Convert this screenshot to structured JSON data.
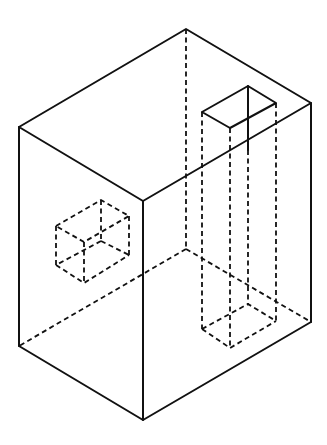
{
  "diagram": {
    "title": "",
    "colors": {
      "line": "#111111",
      "background": "#ffffff"
    },
    "box": {
      "top": [
        186,
        29
      ],
      "left_top": [
        19,
        127
      ],
      "front_top": [
        143,
        201
      ],
      "right_top": [
        311,
        103
      ],
      "left_bottom": [
        19,
        346
      ],
      "front_bottom": [
        143,
        420
      ],
      "right_bottom": [
        311,
        322
      ],
      "back_bottom_hidden": [
        186,
        249
      ]
    },
    "pillar": {
      "top": {
        "left": [
          202,
          112
        ],
        "back": [
          248,
          86
        ],
        "right": [
          276,
          103
        ],
        "front": [
          230,
          128
        ]
      },
      "bottom": {
        "left": [
          202,
          329
        ],
        "back": [
          248,
          304
        ],
        "right": [
          276,
          321
        ],
        "front": [
          230,
          348
        ]
      }
    },
    "small_cube": {
      "top": [
        101,
        200
      ],
      "left_top": [
        56,
        226
      ],
      "right_top": [
        129,
        216
      ],
      "front_top": [
        84,
        242
      ],
      "inner": [
        101,
        241
      ],
      "left_bottom": [
        56,
        265
      ],
      "front_bottom": [
        84,
        283
      ],
      "right_bottom": [
        129,
        255
      ]
    }
  }
}
